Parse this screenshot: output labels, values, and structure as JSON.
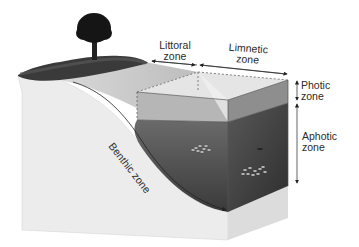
{
  "diagram": {
    "zones": {
      "littoral": {
        "line1": "Littoral",
        "line2": "zone"
      },
      "limnetic": {
        "line1": "Limnetic",
        "line2": "zone"
      },
      "photic": {
        "line1": "Photic",
        "line2": "zone"
      },
      "aphotic": {
        "line1": "Aphotic",
        "line2": "zone"
      },
      "benthic": {
        "label": "Benthic zone"
      }
    },
    "colors": {
      "ground": "#e8e8e8",
      "grass": "#3a3a3a",
      "shallow_water": "#c9c9c9",
      "photic_water": "#9a9a9a",
      "aphotic_water": "#4a4a4a",
      "tree": "#151515"
    }
  }
}
